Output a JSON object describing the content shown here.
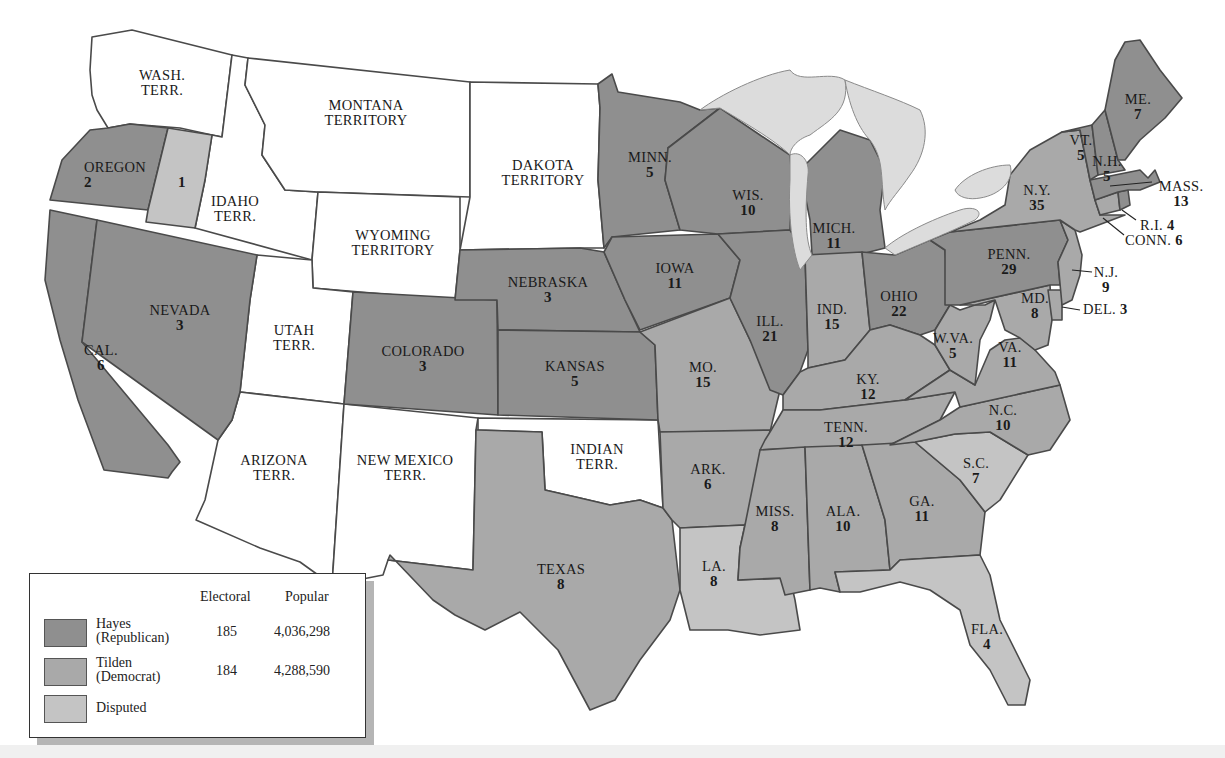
{
  "map": {
    "title": "Election of 1876",
    "colors": {
      "hayes": "#8f8f8f",
      "tilden": "#a9a9a9",
      "disputed": "#c4c4c4",
      "territory": "#ffffff",
      "lakes": "#dcdcdc"
    },
    "territories": [
      {
        "name": "WASH.",
        "name2": "TERR."
      },
      {
        "name": "MONTANA",
        "name2": "TERRITORY"
      },
      {
        "name": "DAKOTA",
        "name2": "TERRITORY"
      },
      {
        "name": "IDAHO",
        "name2": "TERR."
      },
      {
        "name": "WYOMING",
        "name2": "TERRITORY"
      },
      {
        "name": "UTAH",
        "name2": "TERR."
      },
      {
        "name": "ARIZONA",
        "name2": "TERR."
      },
      {
        "name": "NEW MEXICO",
        "name2": "TERR."
      },
      {
        "name": "INDIAN",
        "name2": "TERR."
      }
    ],
    "states": [
      {
        "name": "OREGON",
        "votes": "2",
        "party": "Hayes"
      },
      {
        "name": "",
        "votes": "1",
        "party": "Disputed"
      },
      {
        "name": "CAL.",
        "votes": "6",
        "party": "Hayes"
      },
      {
        "name": "NEVADA",
        "votes": "3",
        "party": "Hayes"
      },
      {
        "name": "COLORADO",
        "votes": "3",
        "party": "Hayes"
      },
      {
        "name": "NEBRASKA",
        "votes": "3",
        "party": "Hayes"
      },
      {
        "name": "KANSAS",
        "votes": "5",
        "party": "Hayes"
      },
      {
        "name": "TEXAS",
        "votes": "8",
        "party": "Tilden"
      },
      {
        "name": "MINN.",
        "votes": "5",
        "party": "Hayes"
      },
      {
        "name": "IOWA",
        "votes": "11",
        "party": "Hayes"
      },
      {
        "name": "MO.",
        "votes": "15",
        "party": "Tilden"
      },
      {
        "name": "ARK.",
        "votes": "6",
        "party": "Tilden"
      },
      {
        "name": "LA.",
        "votes": "8",
        "party": "Disputed"
      },
      {
        "name": "WIS.",
        "votes": "10",
        "party": "Hayes"
      },
      {
        "name": "ILL.",
        "votes": "21",
        "party": "Hayes"
      },
      {
        "name": "MICH.",
        "votes": "11",
        "party": "Hayes"
      },
      {
        "name": "IND.",
        "votes": "15",
        "party": "Tilden"
      },
      {
        "name": "OHIO",
        "votes": "22",
        "party": "Hayes"
      },
      {
        "name": "KY.",
        "votes": "12",
        "party": "Tilden"
      },
      {
        "name": "TENN.",
        "votes": "12",
        "party": "Tilden"
      },
      {
        "name": "MISS.",
        "votes": "8",
        "party": "Tilden"
      },
      {
        "name": "ALA.",
        "votes": "10",
        "party": "Tilden"
      },
      {
        "name": "GA.",
        "votes": "11",
        "party": "Tilden"
      },
      {
        "name": "FLA.",
        "votes": "4",
        "party": "Disputed"
      },
      {
        "name": "S.C.",
        "votes": "7",
        "party": "Disputed"
      },
      {
        "name": "N.C.",
        "votes": "10",
        "party": "Tilden"
      },
      {
        "name": "VA.",
        "votes": "11",
        "party": "Tilden"
      },
      {
        "name": "W.VA.",
        "votes": "5",
        "party": "Tilden"
      },
      {
        "name": "MD.",
        "votes": "8",
        "party": "Tilden"
      },
      {
        "name": "DEL.",
        "votes": "3",
        "party": "Tilden"
      },
      {
        "name": "N.J.",
        "votes": "9",
        "party": "Tilden"
      },
      {
        "name": "PENN.",
        "votes": "29",
        "party": "Hayes"
      },
      {
        "name": "N.Y.",
        "votes": "35",
        "party": "Tilden"
      },
      {
        "name": "CONN.",
        "votes": "6",
        "party": "Tilden"
      },
      {
        "name": "R.I.",
        "votes": "4",
        "party": "Hayes"
      },
      {
        "name": "MASS.",
        "votes": "13",
        "party": "Hayes"
      },
      {
        "name": "VT.",
        "votes": "5",
        "party": "Hayes"
      },
      {
        "name": "N.H.",
        "votes": "5",
        "party": "Hayes"
      },
      {
        "name": "ME.",
        "votes": "7",
        "party": "Hayes"
      }
    ]
  },
  "legend": {
    "col_electoral": "Electoral",
    "col_popular": "Popular",
    "rows": [
      {
        "name": "Hayes",
        "sub": "(Republican)",
        "electoral": "185",
        "popular": "4,036,298",
        "color": "#8f8f8f"
      },
      {
        "name": "Tilden",
        "sub": "(Democrat)",
        "electoral": "184",
        "popular": "4,288,590",
        "color": "#a9a9a9"
      },
      {
        "name": "Disputed",
        "sub": "",
        "electoral": "",
        "popular": "",
        "color": "#c4c4c4"
      }
    ]
  }
}
